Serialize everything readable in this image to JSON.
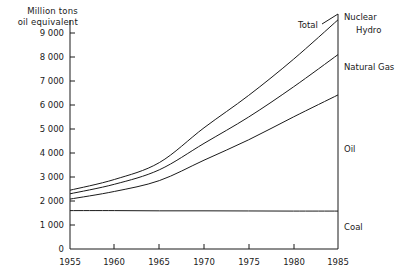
{
  "chart_data": {
    "type": "area",
    "title": "",
    "ylabel": "Million tons\noil equivalent",
    "ylabel_line1": "Million tons",
    "ylabel_line2": "oil equivalent",
    "xlabel": "",
    "xlim": [
      1955,
      1985
    ],
    "ylim": [
      0,
      9600
    ],
    "grid": false,
    "legend_position": "right-inline",
    "yticks": [
      0,
      1000,
      2000,
      3000,
      4000,
      5000,
      6000,
      7000,
      8000,
      9000
    ],
    "ytick_labels": [
      "0",
      "1 000",
      "2 000",
      "3 000",
      "4 000",
      "5 000",
      "6 000",
      "7 000",
      "8 000",
      "9 000"
    ],
    "xticks": [
      1955,
      1960,
      1965,
      1970,
      1975,
      1980,
      1985
    ],
    "xtick_labels": [
      "1955",
      "1960",
      "1965",
      "1970",
      "1975",
      "1980",
      "1985"
    ],
    "x": [
      1955,
      1960,
      1965,
      1970,
      1975,
      1980,
      1985
    ],
    "annotations": [
      {
        "name": "total-curve-label",
        "text": "Total",
        "x": 1980,
        "y": 9300
      },
      {
        "name": "nuclear-label",
        "text": "Nuclear",
        "x": 1986,
        "y": 9500
      },
      {
        "name": "hydro-label",
        "text": "Hydro",
        "x": 1987,
        "y": 9050
      },
      {
        "name": "natural-gas-label",
        "text": "Natural Gas",
        "x": 1986,
        "y": 7300
      },
      {
        "name": "oil-label",
        "text": "Oil",
        "x": 1986,
        "y": 4100
      },
      {
        "name": "coal-label",
        "text": "Coal",
        "x": 1986,
        "y": 900
      }
    ],
    "series": [
      {
        "name": "Total",
        "label": "Total",
        "description": "cumulative top boundary including Nuclear and Hydro",
        "values": [
          2450,
          2900,
          3600,
          5050,
          6400,
          7900,
          9550
        ]
      },
      {
        "name": "Natural Gas",
        "label": "Natural Gas",
        "description": "cumulative boundary: Coal + Oil + Natural Gas",
        "values": [
          2300,
          2700,
          3300,
          4400,
          5500,
          6750,
          8100
        ]
      },
      {
        "name": "Oil",
        "label": "Oil",
        "description": "cumulative boundary: Coal + Oil",
        "values": [
          2080,
          2400,
          2850,
          3700,
          4550,
          5500,
          6420
        ]
      },
      {
        "name": "Coal",
        "label": "Coal",
        "description": "cumulative boundary: Coal only (near flat)",
        "values": [
          1600,
          1600,
          1590,
          1590,
          1585,
          1580,
          1580
        ]
      }
    ]
  },
  "axes": {
    "y_title_line1": "Million tons",
    "y_title_line2": "oil equivalent",
    "zero_label": "0"
  }
}
